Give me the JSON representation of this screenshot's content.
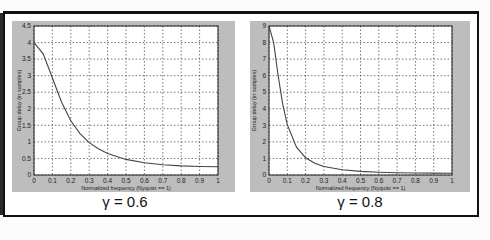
{
  "labels": {
    "left": "γ = 0.6",
    "right": "γ = 0.8"
  },
  "chart_data": [
    {
      "type": "line",
      "title": "γ = 0.6",
      "xlabel": "Normalized frequency (Nyquist == 1)",
      "ylabel": "Group delay (in samples)",
      "xlim": [
        0,
        1
      ],
      "ylim": [
        0,
        4.5
      ],
      "xticks": [
        "0",
        "0.1",
        "0.2",
        "0.3",
        "0.4",
        "0.5",
        "0.6",
        "0.7",
        "0.8",
        "0.9",
        "1"
      ],
      "yticks": [
        "0",
        "0.5",
        "1",
        "1.5",
        "2",
        "2.5",
        "3",
        "3.5",
        "4",
        "4.5"
      ],
      "grid": true,
      "x": [
        0,
        0.05,
        0.1,
        0.15,
        0.2,
        0.25,
        0.3,
        0.35,
        0.4,
        0.5,
        0.6,
        0.7,
        0.8,
        0.9,
        1.0
      ],
      "y": [
        4.0,
        3.66,
        2.93,
        2.2,
        1.64,
        1.25,
        0.98,
        0.79,
        0.65,
        0.47,
        0.37,
        0.31,
        0.275,
        0.256,
        0.25
      ]
    },
    {
      "type": "line",
      "title": "γ = 0.8",
      "xlabel": "Normalized frequency (Nyquist == 1)",
      "ylabel": "Group delay (in samples)",
      "xlim": [
        0,
        1
      ],
      "ylim": [
        0,
        9
      ],
      "xticks": [
        "0",
        "0.1",
        "0.2",
        "0.3",
        "0.4",
        "0.5",
        "0.6",
        "0.7",
        "0.8",
        "0.9",
        "1"
      ],
      "yticks": [
        "0",
        "1",
        "2",
        "3",
        "4",
        "5",
        "6",
        "7",
        "8",
        "9"
      ],
      "grid": true,
      "x": [
        0,
        0.025,
        0.05,
        0.075,
        0.1,
        0.15,
        0.2,
        0.25,
        0.3,
        0.4,
        0.5,
        0.6,
        0.7,
        0.8,
        0.9,
        1.0
      ],
      "y": [
        9.0,
        8.01,
        6.03,
        4.28,
        3.04,
        1.68,
        1.04,
        0.71,
        0.515,
        0.315,
        0.22,
        0.17,
        0.14,
        0.123,
        0.114,
        0.111
      ]
    }
  ]
}
